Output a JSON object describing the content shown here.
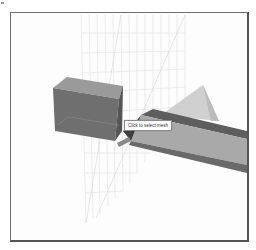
{
  "viewport": {
    "label": "3D scene viewport",
    "objects": [
      {
        "name": "box-mesh",
        "color": "#6f6f6f"
      },
      {
        "name": "channel-mesh",
        "color": "#8c8c8c"
      },
      {
        "name": "triangle-mesh",
        "color": "#c4c4c4"
      },
      {
        "name": "grid-plane",
        "color": "#e2e2e2"
      }
    ]
  },
  "tooltip": {
    "text": "Click to select mesh"
  },
  "colors": {
    "frame": "#6e6e6e",
    "background": "#fdfdfd"
  }
}
